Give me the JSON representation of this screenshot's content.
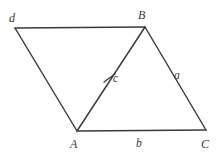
{
  "figure": {
    "type": "geometry-diagram",
    "background_color": "#ffffff",
    "line_color": "#3a3a3a",
    "canvas": {
      "width": 221,
      "height": 158
    },
    "vertices": [
      {
        "id": "d",
        "label": "d",
        "x": 15,
        "y": 28,
        "label_x": 9,
        "label_y": 12
      },
      {
        "id": "B",
        "label": "B",
        "x": 145,
        "y": 27,
        "label_x": 138,
        "label_y": 9
      },
      {
        "id": "C",
        "label": "C",
        "x": 206,
        "y": 130,
        "label_x": 201,
        "label_y": 138
      },
      {
        "id": "A",
        "label": "A",
        "x": 77,
        "y": 131,
        "label_x": 70,
        "label_y": 138
      }
    ],
    "edges": [
      {
        "id": "top",
        "from": "d",
        "to": "B"
      },
      {
        "id": "right",
        "from": "B",
        "to": "C",
        "side_label": "a"
      },
      {
        "id": "bottom",
        "from": "A",
        "to": "C",
        "side_label": "b"
      },
      {
        "id": "left",
        "from": "d",
        "to": "A"
      }
    ],
    "diagonal": {
      "id": "diag",
      "from": "A",
      "to": "B",
      "side_label": "c"
    },
    "side_labels": [
      {
        "id": "a",
        "label": "a",
        "x": 174,
        "y": 70,
        "belongs_to": "right-edge"
      },
      {
        "id": "b",
        "label": "b",
        "x": 136,
        "y": 138,
        "belongs_to": "bottom-edge"
      },
      {
        "id": "c",
        "label": "c",
        "x": 113,
        "y": 73,
        "belongs_to": "diagonal"
      },
      {
        "id": "d",
        "label": "d",
        "x": 9,
        "y": 12,
        "belongs_to": "left-edge-vertex"
      }
    ],
    "tick_mark": {
      "id": "congruence-tick",
      "x1": 104,
      "y1": 82,
      "x2": 115,
      "y2": 74,
      "on": "diagonal"
    }
  }
}
